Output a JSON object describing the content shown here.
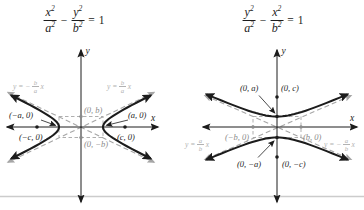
{
  "colors": {
    "ink": "#1c1c1c",
    "asymptote_line": "#a6a6a6",
    "asymptote_label_text": "#b2b2b2",
    "corner_label_text": "#8a8a8a",
    "gray_dot": "#8a8a8a",
    "page_rule_line": "#cccccc",
    "background": "#ffffff"
  },
  "left": {
    "equation": {
      "num1_var": "x",
      "num1_exp": "2",
      "den1_var": "a",
      "den1_exp": "2",
      "minus": "−",
      "num2_var": "y",
      "num2_exp": "2",
      "den2_var": "b",
      "den2_exp": "2",
      "equals": "=",
      "rhs": "1"
    },
    "axis_labels": {
      "x": "x",
      "y": "y"
    },
    "asym_neg": {
      "pre": "y = −",
      "num": "b",
      "den": "a",
      "post": "x"
    },
    "asym_pos": {
      "pre": "y = ",
      "num": "b",
      "den": "a",
      "post": "x"
    },
    "point_labels": {
      "top": "(0, b)",
      "bottom": "(0, −b)",
      "vertex_left": "(−a, 0)",
      "vertex_right": "(a, 0)",
      "focus_left": "(−c, 0)",
      "focus_right": "(c, 0)"
    }
  },
  "right": {
    "equation": {
      "num1_var": "y",
      "num1_exp": "2",
      "den1_var": "a",
      "den1_exp": "2",
      "minus": "−",
      "num2_var": "x",
      "num2_exp": "2",
      "den2_var": "b",
      "den2_exp": "2",
      "equals": "=",
      "rhs": "1"
    },
    "axis_labels": {
      "x": "x",
      "y": "y"
    },
    "asym_pos": {
      "pre": "y = ",
      "num": "a",
      "den": "b",
      "post": "x"
    },
    "asym_neg": {
      "pre": "y = −",
      "num": "a",
      "den": "b",
      "post": "x"
    },
    "point_labels": {
      "top_vertex": "(0, a)",
      "top_focus": "(0, c)",
      "left": "(−b, 0)",
      "right": "(b, 0)",
      "bottom_vertex": "(0, −a)",
      "bottom_focus": "(0, −c)"
    }
  },
  "geom": {
    "left": {
      "cx": 81,
      "cy": 127,
      "a": 22,
      "b": 10.5,
      "tmax": 1.82,
      "orient": "h"
    },
    "right": {
      "cx": 277,
      "cy": 127,
      "a": 10.5,
      "b": 24,
      "tmax": 1.8,
      "orient": "v"
    }
  }
}
